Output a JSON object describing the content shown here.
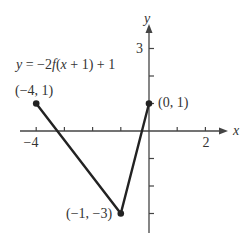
{
  "chart_data": {
    "type": "line",
    "title": "y = −2f(x + 1) + 1",
    "xlabel": "x",
    "ylabel": "y",
    "xlim": [
      -4.5,
      2.6
    ],
    "ylim": [
      -3.6,
      3.7
    ],
    "grid": false,
    "x_tick_labels": [
      {
        "value": -4,
        "label": "−4"
      },
      {
        "value": 2,
        "label": "2"
      }
    ],
    "y_tick_labels": [
      {
        "value": 3,
        "label": "3"
      }
    ],
    "x_ticks": [
      -4,
      -3,
      -2,
      -1,
      0,
      1,
      2
    ],
    "y_ticks": [
      -3,
      -2,
      -1,
      1,
      2,
      3
    ],
    "series": [
      {
        "name": "y = −2f(x + 1) + 1",
        "points": [
          {
            "x": -4,
            "y": 1,
            "label": "(−4, 1)"
          },
          {
            "x": -1,
            "y": -3,
            "label": "(−1, −3)"
          },
          {
            "x": 0,
            "y": 1,
            "label": "(0, 1)"
          }
        ],
        "color": "#222222"
      }
    ]
  }
}
